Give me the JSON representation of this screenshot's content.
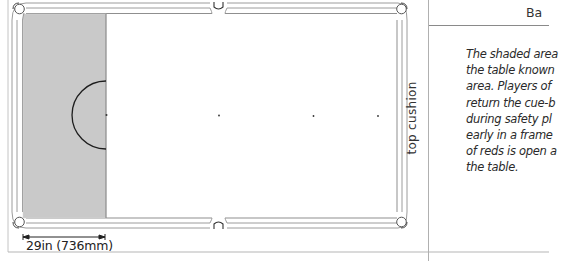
{
  "diagram": {
    "header_label": "Ba",
    "cushion_label": "top cushion",
    "dimension_label": "29in  (736mm)",
    "caption_lines": [
      "The shaded area",
      "the table known",
      "area. Players of",
      "return the cue-b",
      "during safety pl",
      "early in a frame",
      "of reds is open a",
      "the table."
    ],
    "colors": {
      "shaded_area": "#c9c9c9",
      "lines": "#9a9a9a",
      "d_line": "#1a1a1a",
      "frame": "#bdbdbd"
    },
    "table": {
      "pockets": [
        "top-left",
        "top-middle",
        "top-right",
        "bottom-left",
        "bottom-middle",
        "bottom-right"
      ],
      "spots": [
        "baulk-line-center",
        "blue",
        "pink",
        "black"
      ]
    }
  }
}
